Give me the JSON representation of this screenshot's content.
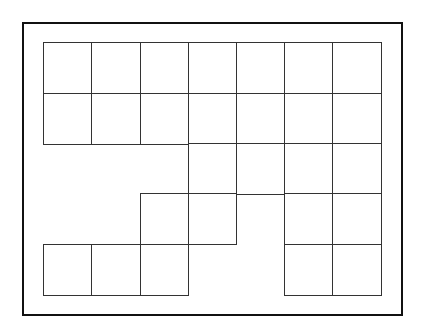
{
  "diagram": {
    "type": "grid-shape",
    "columns": 7,
    "rows": 5,
    "origin": {
      "x": 44,
      "y": 43
    },
    "cell_width": 48.14,
    "cell_height": 50.4,
    "line_color": "#333333",
    "frame_color": "#111111",
    "filled_cells": [
      [
        0,
        0
      ],
      [
        0,
        1
      ],
      [
        0,
        2
      ],
      [
        0,
        3
      ],
      [
        0,
        4
      ],
      [
        0,
        5
      ],
      [
        0,
        6
      ],
      [
        1,
        0
      ],
      [
        1,
        1
      ],
      [
        1,
        2
      ],
      [
        1,
        3
      ],
      [
        1,
        4
      ],
      [
        1,
        5
      ],
      [
        1,
        6
      ],
      [
        2,
        3
      ],
      [
        2,
        4
      ],
      [
        2,
        5
      ],
      [
        2,
        6
      ],
      [
        3,
        2
      ],
      [
        3,
        3
      ],
      [
        3,
        5
      ],
      [
        3,
        6
      ],
      [
        4,
        0
      ],
      [
        4,
        1
      ],
      [
        4,
        2
      ],
      [
        4,
        5
      ],
      [
        4,
        6
      ]
    ],
    "cell_count": 27
  }
}
